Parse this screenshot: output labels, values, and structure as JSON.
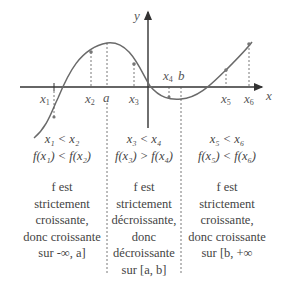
{
  "axes": {
    "x_label": "x",
    "y_label": "y"
  },
  "points": {
    "x1": {
      "name": "x",
      "sub": "1"
    },
    "x2": {
      "name": "x",
      "sub": "2"
    },
    "a": {
      "name": "a"
    },
    "x3": {
      "name": "x",
      "sub": "3"
    },
    "x4": {
      "name": "x",
      "sub": "4"
    },
    "b": {
      "name": "b"
    },
    "x5": {
      "name": "x",
      "sub": "5"
    },
    "x6": {
      "name": "x",
      "sub": "6"
    }
  },
  "columns": [
    {
      "ineq1": "x₁ < x₂",
      "ineq2": "f(x₁) < f(x₂)",
      "lines": [
        "f est",
        "strictement",
        "croissante,",
        "donc croissante",
        "sur -∞, a]"
      ]
    },
    {
      "ineq1": "x₃ < x₄",
      "ineq2": "f(x₃) > f(x₄)",
      "lines": [
        "f est",
        "strictement",
        "décroissante,",
        "donc",
        "décroissante",
        "sur [a, b]"
      ]
    },
    {
      "ineq1": "x₅ < x₆",
      "ineq2": "f(x₅) < f(x₆)",
      "lines": [
        "f est",
        "strictement",
        "croissante,",
        "donc croissante",
        "sur [b, +∞"
      ]
    }
  ],
  "colors": {
    "curve": "#6a6a6a",
    "axis": "#333333",
    "dash": "#555555",
    "text": "#444444"
  }
}
